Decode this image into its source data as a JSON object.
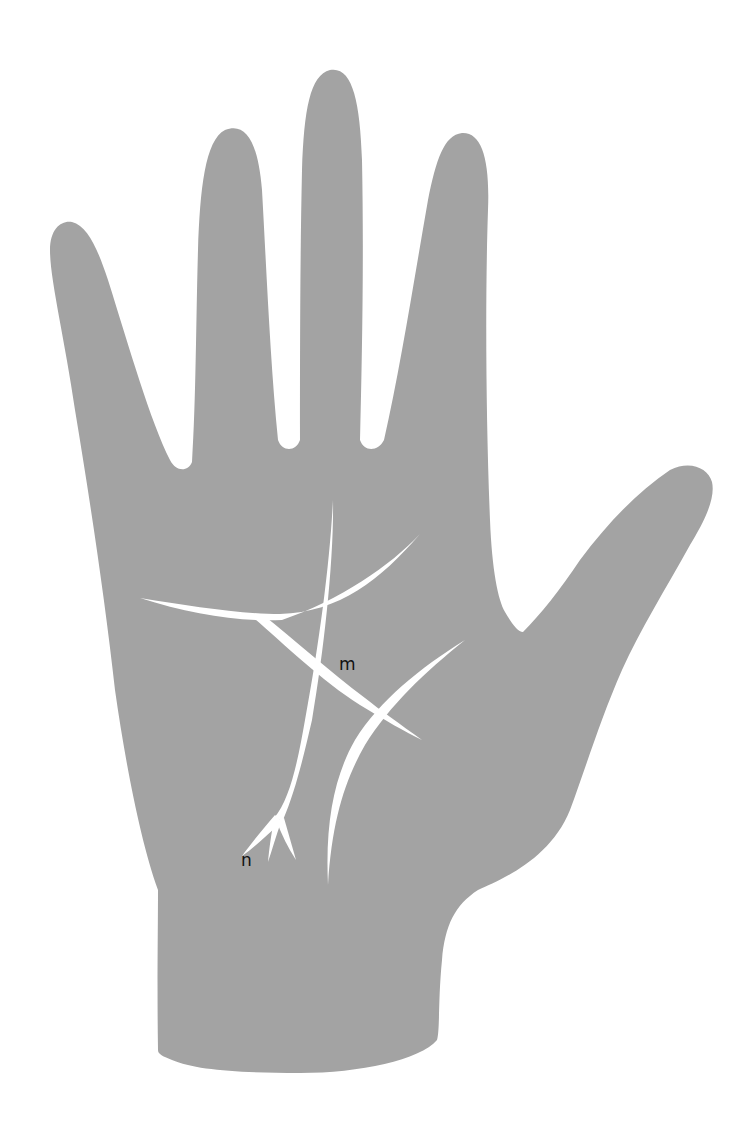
{
  "figure": {
    "colors": {
      "background": "#ffffff",
      "hand": "#a3a3a3",
      "lines": "#ffffff",
      "label_text": "#111111"
    }
  },
  "labels": {
    "m": "m",
    "n": "n"
  }
}
